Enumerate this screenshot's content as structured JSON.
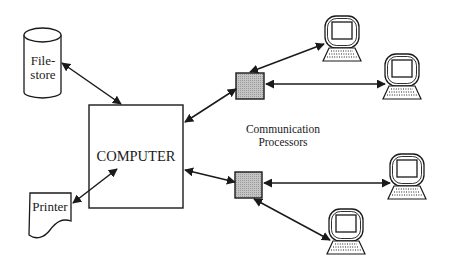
{
  "diagram": {
    "nodes": {
      "filestore": {
        "label_line1": "File-",
        "label_line2": "store",
        "shape": "cylinder"
      },
      "printer": {
        "label": "Printer",
        "shape": "document"
      },
      "computer": {
        "label": "COMPUTER",
        "shape": "rectangle"
      },
      "processor_top": {
        "shape": "shaded-square"
      },
      "processor_bottom": {
        "shape": "shaded-square"
      },
      "terminals": [
        {
          "id": "terminal-1",
          "shape": "terminal-icon"
        },
        {
          "id": "terminal-2",
          "shape": "terminal-icon"
        },
        {
          "id": "terminal-3",
          "shape": "terminal-icon"
        },
        {
          "id": "terminal-4",
          "shape": "terminal-icon"
        }
      ]
    },
    "annotation": {
      "line1": "Communication",
      "line2": "Processors"
    },
    "edges": [
      {
        "from": "filestore",
        "to": "computer",
        "type": "bidirectional-arrow"
      },
      {
        "from": "printer",
        "to": "computer",
        "type": "bidirectional-arrow"
      },
      {
        "from": "computer",
        "to": "processor_top",
        "type": "bidirectional-arrow"
      },
      {
        "from": "computer",
        "to": "processor_bottom",
        "type": "bidirectional-arrow"
      },
      {
        "from": "processor_top",
        "to": "terminal-1",
        "type": "bidirectional-arrow"
      },
      {
        "from": "processor_top",
        "to": "terminal-2",
        "type": "bidirectional-arrow"
      },
      {
        "from": "processor_bottom",
        "to": "terminal-3",
        "type": "bidirectional-arrow"
      },
      {
        "from": "processor_bottom",
        "to": "terminal-4",
        "type": "bidirectional-arrow"
      }
    ],
    "colors": {
      "stroke": "#1a1a1a",
      "processor_fill": "#b8b8b8",
      "background": "#ffffff"
    }
  }
}
